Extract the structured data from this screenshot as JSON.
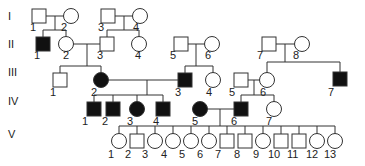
{
  "generations": [
    {
      "label": "I",
      "y": 16
    },
    {
      "label": "II",
      "y": 44
    },
    {
      "label": "III",
      "y": 72
    },
    {
      "label": "IV",
      "y": 101
    },
    {
      "label": "V",
      "y": 134
    }
  ],
  "individuals": [
    {
      "id": "I-1",
      "gen": "I",
      "num": "1",
      "sex": "male",
      "affected": false,
      "x": 39,
      "y": 16,
      "lx": 30,
      "ly": 31
    },
    {
      "id": "I-2",
      "gen": "I",
      "num": "2",
      "sex": "female",
      "affected": false,
      "x": 71,
      "y": 16,
      "lx": 61,
      "ly": 31
    },
    {
      "id": "I-3",
      "gen": "I",
      "num": "3",
      "sex": "male",
      "affected": false,
      "x": 108,
      "y": 16,
      "lx": 98,
      "ly": 31
    },
    {
      "id": "I-4",
      "gen": "I",
      "num": "4",
      "sex": "female",
      "affected": false,
      "x": 140,
      "y": 16,
      "lx": 133,
      "ly": 31
    },
    {
      "id": "II-1",
      "gen": "II",
      "num": "1",
      "sex": "male",
      "affected": true,
      "x": 43,
      "y": 44,
      "lx": 34,
      "ly": 59
    },
    {
      "id": "II-2",
      "gen": "II",
      "num": "2",
      "sex": "female",
      "affected": false,
      "x": 66,
      "y": 44,
      "lx": 63,
      "ly": 59
    },
    {
      "id": "II-3",
      "gen": "II",
      "num": "3",
      "sex": "male",
      "affected": false,
      "x": 107,
      "y": 44,
      "lx": 97,
      "ly": 59
    },
    {
      "id": "II-4",
      "gen": "II",
      "num": "4",
      "sex": "female",
      "affected": false,
      "x": 139,
      "y": 44,
      "lx": 135,
      "ly": 59
    },
    {
      "id": "II-5",
      "gen": "II",
      "num": "5",
      "sex": "male",
      "affected": false,
      "x": 181,
      "y": 44,
      "lx": 170,
      "ly": 59
    },
    {
      "id": "II-6",
      "gen": "II",
      "num": "6",
      "sex": "female",
      "affected": false,
      "x": 212,
      "y": 44,
      "lx": 205,
      "ly": 59
    },
    {
      "id": "II-7",
      "gen": "II",
      "num": "7",
      "sex": "male",
      "affected": false,
      "x": 269,
      "y": 44,
      "lx": 257,
      "ly": 59
    },
    {
      "id": "II-8",
      "gen": "II",
      "num": "8",
      "sex": "female",
      "affected": false,
      "x": 302,
      "y": 44,
      "lx": 293,
      "ly": 59
    },
    {
      "id": "III-1",
      "gen": "III",
      "num": "1",
      "sex": "male",
      "affected": false,
      "x": 60,
      "y": 80,
      "lx": 50,
      "ly": 96
    },
    {
      "id": "III-2",
      "gen": "III",
      "num": "2",
      "sex": "female",
      "affected": true,
      "x": 101,
      "y": 80,
      "lx": 91,
      "ly": 96
    },
    {
      "id": "III-3",
      "gen": "III",
      "num": "3",
      "sex": "male",
      "affected": true,
      "x": 185,
      "y": 80,
      "lx": 175,
      "ly": 96
    },
    {
      "id": "III-4",
      "gen": "III",
      "num": "4",
      "sex": "female",
      "affected": false,
      "x": 213,
      "y": 80,
      "lx": 206,
      "ly": 96
    },
    {
      "id": "III-5",
      "gen": "III",
      "num": "5",
      "sex": "male",
      "affected": false,
      "x": 241,
      "y": 80,
      "lx": 229,
      "ly": 96
    },
    {
      "id": "III-6",
      "gen": "III",
      "num": "6",
      "sex": "female",
      "affected": false,
      "x": 267,
      "y": 80,
      "lx": 260,
      "ly": 96
    },
    {
      "id": "III-7",
      "gen": "III",
      "num": "7",
      "sex": "male",
      "affected": true,
      "x": 340,
      "y": 79,
      "lx": 328,
      "ly": 96
    },
    {
      "id": "IV-1",
      "gen": "IV",
      "num": "1",
      "sex": "male",
      "affected": true,
      "x": 94,
      "y": 109,
      "lx": 82,
      "ly": 125
    },
    {
      "id": "IV-2",
      "gen": "IV",
      "num": "2",
      "sex": "male",
      "affected": true,
      "x": 113,
      "y": 109,
      "lx": 102,
      "ly": 125
    },
    {
      "id": "IV-3",
      "gen": "IV",
      "num": "3",
      "sex": "female",
      "affected": true,
      "x": 137,
      "y": 109,
      "lx": 127,
      "ly": 125
    },
    {
      "id": "IV-4",
      "gen": "IV",
      "num": "4",
      "sex": "male",
      "affected": true,
      "x": 163,
      "y": 109,
      "lx": 153,
      "ly": 125
    },
    {
      "id": "IV-5",
      "gen": "IV",
      "num": "5",
      "sex": "female",
      "affected": true,
      "x": 200,
      "y": 109,
      "lx": 192,
      "ly": 125
    },
    {
      "id": "IV-6",
      "gen": "IV",
      "num": "6",
      "sex": "male",
      "affected": true,
      "x": 241,
      "y": 109,
      "lx": 231,
      "ly": 125
    },
    {
      "id": "IV-7",
      "gen": "IV",
      "num": "7",
      "sex": "female",
      "affected": false,
      "x": 274,
      "y": 109,
      "lx": 266,
      "ly": 125
    },
    {
      "id": "V-1",
      "gen": "V",
      "num": "1",
      "sex": "female",
      "affected": false,
      "x": 119,
      "y": 141,
      "lx": 108,
      "ly": 158
    },
    {
      "id": "V-2",
      "gen": "V",
      "num": "2",
      "sex": "male",
      "affected": false,
      "x": 137,
      "y": 141,
      "lx": 125,
      "ly": 158
    },
    {
      "id": "V-3",
      "gen": "V",
      "num": "3",
      "sex": "female",
      "affected": false,
      "x": 155,
      "y": 141,
      "lx": 142,
      "ly": 158
    },
    {
      "id": "V-4",
      "gen": "V",
      "num": "4",
      "sex": "female",
      "affected": false,
      "x": 173,
      "y": 141,
      "lx": 161,
      "ly": 158
    },
    {
      "id": "V-5",
      "gen": "V",
      "num": "5",
      "sex": "female",
      "affected": false,
      "x": 191,
      "y": 141,
      "lx": 179,
      "ly": 158
    },
    {
      "id": "V-6",
      "gen": "V",
      "num": "6",
      "sex": "female",
      "affected": false,
      "x": 209,
      "y": 141,
      "lx": 197,
      "ly": 158
    },
    {
      "id": "V-7",
      "gen": "V",
      "num": "7",
      "sex": "male",
      "affected": false,
      "x": 227,
      "y": 141,
      "lx": 215,
      "ly": 158
    },
    {
      "id": "V-8",
      "gen": "V",
      "num": "8",
      "sex": "male",
      "affected": false,
      "x": 245,
      "y": 141,
      "lx": 234,
      "ly": 158
    },
    {
      "id": "V-9",
      "gen": "V",
      "num": "9",
      "sex": "female",
      "affected": false,
      "x": 263,
      "y": 141,
      "lx": 253,
      "ly": 158
    },
    {
      "id": "V-10",
      "gen": "V",
      "num": "10",
      "sex": "male",
      "affected": false,
      "x": 281,
      "y": 141,
      "lx": 268,
      "ly": 158
    },
    {
      "id": "V-11",
      "gen": "V",
      "num": "11",
      "sex": "male",
      "affected": false,
      "x": 299,
      "y": 141,
      "lx": 287,
      "ly": 158
    },
    {
      "id": "V-12",
      "gen": "V",
      "num": "12",
      "sex": "female",
      "affected": false,
      "x": 317,
      "y": 141,
      "lx": 306,
      "ly": 158
    },
    {
      "id": "V-13",
      "gen": "V",
      "num": "13",
      "sex": "female",
      "affected": false,
      "x": 335,
      "y": 141,
      "lx": 324,
      "ly": 158
    }
  ],
  "lines": [
    [
      46,
      16,
      64,
      16
    ],
    [
      55,
      16,
      55,
      30
    ],
    [
      43,
      30,
      66,
      30
    ],
    [
      43,
      30,
      43,
      37
    ],
    [
      66,
      30,
      66,
      37
    ],
    [
      115,
      16,
      133,
      16
    ],
    [
      124,
      16,
      124,
      30
    ],
    [
      107,
      30,
      139,
      30
    ],
    [
      107,
      30,
      107,
      37
    ],
    [
      139,
      30,
      139,
      37
    ],
    [
      73,
      44,
      100,
      44
    ],
    [
      87,
      44,
      87,
      66
    ],
    [
      60,
      66,
      101,
      66
    ],
    [
      60,
      66,
      60,
      73
    ],
    [
      101,
      66,
      101,
      73
    ],
    [
      188,
      44,
      205,
      44
    ],
    [
      196,
      44,
      196,
      66
    ],
    [
      185,
      66,
      213,
      66
    ],
    [
      185,
      66,
      185,
      73
    ],
    [
      213,
      66,
      213,
      73
    ],
    [
      276,
      44,
      295,
      44
    ],
    [
      285,
      44,
      285,
      62
    ],
    [
      267,
      62,
      340,
      62
    ],
    [
      267,
      62,
      267,
      73
    ],
    [
      340,
      62,
      340,
      72
    ],
    [
      108,
      80,
      178,
      80
    ],
    [
      147,
      80,
      147,
      95
    ],
    [
      94,
      95,
      163,
      95
    ],
    [
      94,
      95,
      94,
      102
    ],
    [
      113,
      95,
      113,
      102
    ],
    [
      137,
      95,
      137,
      102
    ],
    [
      163,
      95,
      163,
      102
    ],
    [
      248,
      80,
      260,
      80
    ],
    [
      254,
      80,
      254,
      95
    ],
    [
      241,
      95,
      274,
      95
    ],
    [
      241,
      95,
      241,
      102
    ],
    [
      274,
      95,
      274,
      102
    ],
    [
      207,
      109,
      234,
      109
    ],
    [
      220,
      109,
      220,
      126
    ],
    [
      119,
      126,
      335,
      126
    ],
    [
      119,
      126,
      119,
      134
    ],
    [
      137,
      126,
      137,
      134
    ],
    [
      155,
      126,
      155,
      134
    ],
    [
      173,
      126,
      173,
      134
    ],
    [
      191,
      126,
      191,
      134
    ],
    [
      209,
      126,
      209,
      134
    ],
    [
      227,
      126,
      227,
      134
    ],
    [
      245,
      126,
      245,
      134
    ],
    [
      263,
      126,
      263,
      134
    ],
    [
      281,
      126,
      281,
      134
    ],
    [
      299,
      126,
      299,
      134
    ],
    [
      317,
      126,
      317,
      134
    ],
    [
      335,
      126,
      335,
      134
    ]
  ],
  "colors": {
    "stroke": "#333333",
    "affected": "#111111",
    "unaffected": "#ffffff",
    "text": "#222222"
  }
}
